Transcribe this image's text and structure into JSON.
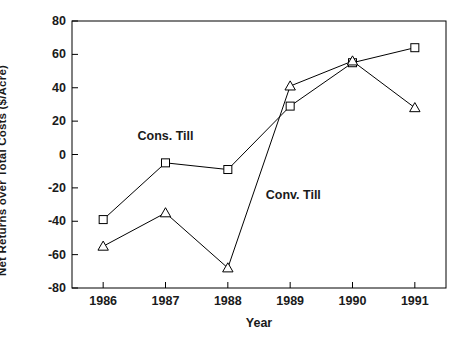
{
  "chart_data": {
    "type": "line",
    "title": "",
    "xlabel": "Year",
    "ylabel": "Net Returns over Total Costs ($/Acre)",
    "categories": [
      "1986",
      "1987",
      "1988",
      "1989",
      "1990",
      "1991"
    ],
    "x": [
      1986,
      1987,
      1988,
      1989,
      1990,
      1991
    ],
    "xlim": [
      1985.5,
      1991.5
    ],
    "ylim": [
      -80,
      80
    ],
    "yticks": [
      80,
      60,
      40,
      20,
      0,
      -20,
      -40,
      -60,
      -80
    ],
    "ytick_labels": [
      "80",
      "60",
      "40",
      "20",
      "0",
      "-20",
      "-40",
      "-60",
      "-80"
    ],
    "grid": false,
    "legend_position": "inline-annotations",
    "series": [
      {
        "name": "Cons. Till",
        "marker": "square-open",
        "color": "#000000",
        "values": [
          -39,
          -5,
          -9,
          29,
          55,
          64
        ]
      },
      {
        "name": "Conv. Till",
        "marker": "triangle-open",
        "color": "#000000",
        "values": [
          -55,
          -35,
          -68,
          41,
          56,
          28
        ]
      }
    ],
    "annotations": [
      {
        "text": "Cons. Till",
        "x": 1987.0,
        "y": 11
      },
      {
        "text": "Conv. Till",
        "x": 1989.05,
        "y": -24
      }
    ]
  },
  "axes": {
    "frame_color": "#000000",
    "background": "#ffffff"
  }
}
